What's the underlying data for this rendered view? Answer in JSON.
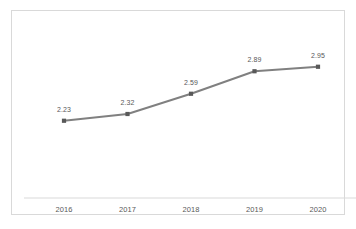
{
  "chart_data": {
    "type": "line",
    "title": "",
    "subtitle": "",
    "xlabel": "",
    "ylabel": "",
    "categories": [
      "2016",
      "2017",
      "2018",
      "2019",
      "2020"
    ],
    "values": [
      2.23,
      2.32,
      2.59,
      2.89,
      2.95
    ],
    "value_labels": [
      "2.23",
      "2.32",
      "2.59",
      "2.89",
      "2.95"
    ],
    "series": [
      {
        "name": "",
        "values": [
          2.23,
          2.32,
          2.59,
          2.89,
          2.95
        ]
      }
    ],
    "ylim": [
      1.6,
      3.2
    ],
    "grid": false,
    "legend": false,
    "legend_position": "none",
    "show_data_labels": true,
    "y_axis_visible": false,
    "x_axis_visible": true,
    "marker": "square",
    "colors": {
      "line": "#808080",
      "marker": "#595959",
      "axis_line": "#d9d9d9",
      "frame_border": "#d9d9d9",
      "label_text": "#595959",
      "plot_background": "#ffffff"
    }
  }
}
